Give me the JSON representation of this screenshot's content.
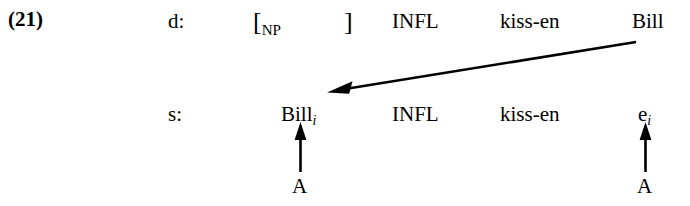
{
  "example": {
    "number": "(21)"
  },
  "levels": {
    "deep_structure_label": "d:",
    "surface_structure_label": "s:"
  },
  "deep_structure": {
    "bracket_open": "[",
    "bracket_open_subscript": "NP",
    "bracket_close": "]",
    "infl": "INFL",
    "verb": "kiss-en",
    "subject": "Bill"
  },
  "surface_structure": {
    "subject": "Bill",
    "subject_subscript": "i",
    "infl": "INFL",
    "verb": "kiss-en",
    "trace": "e",
    "trace_subscript": "i"
  },
  "operations": {
    "left_label": "A",
    "right_label": "A"
  },
  "colors": {
    "ink": "#000000",
    "background": "#ffffff"
  }
}
